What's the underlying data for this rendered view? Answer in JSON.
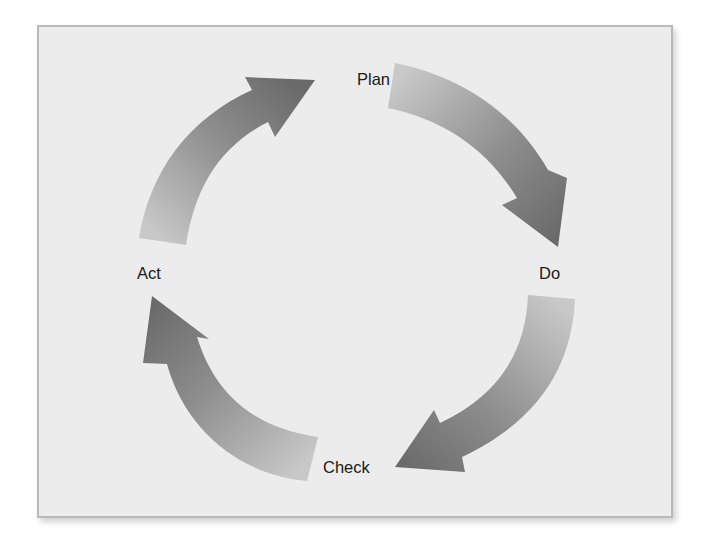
{
  "diagram": {
    "type": "cycle",
    "name": "PDCA cycle",
    "stages": [
      {
        "id": "plan",
        "label": "Plan"
      },
      {
        "id": "do",
        "label": "Do"
      },
      {
        "id": "check",
        "label": "Check"
      },
      {
        "id": "act",
        "label": "Act"
      }
    ],
    "edges": [
      {
        "from": "plan",
        "to": "do"
      },
      {
        "from": "do",
        "to": "check"
      },
      {
        "from": "check",
        "to": "act"
      },
      {
        "from": "act",
        "to": "plan"
      }
    ],
    "direction": "clockwise"
  },
  "colors": {
    "background": "#ffffff",
    "panel": "#ececec",
    "panel_border": "#b9b9b9",
    "arrow_light": "#c4c4c4",
    "arrow_dark": "#6a6a6a",
    "label_text": "#1a1a1a"
  }
}
